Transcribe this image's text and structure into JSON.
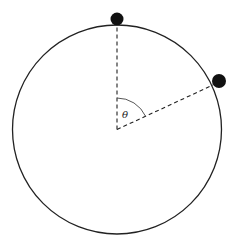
{
  "diagram": {
    "type": "circular-motion",
    "circle": {
      "cx": 117,
      "cy": 129.5,
      "r": 104.5,
      "stroke": "#222222"
    },
    "center": {
      "x": 117,
      "y": 129.5
    },
    "balls": [
      {
        "name": "top-ball",
        "cx": 117,
        "cy": 19,
        "r": 6.5,
        "fill": "#111111"
      },
      {
        "name": "right-ball",
        "cx": 219,
        "cy": 81,
        "r": 7,
        "fill": "#111111"
      }
    ],
    "radii": [
      {
        "name": "vertical-radius",
        "x2": 117,
        "y2": 26
      },
      {
        "name": "angled-radius",
        "x2": 213,
        "y2": 85
      }
    ],
    "angle": {
      "label": "θ",
      "label_x": 122,
      "label_y": 118
    }
  }
}
